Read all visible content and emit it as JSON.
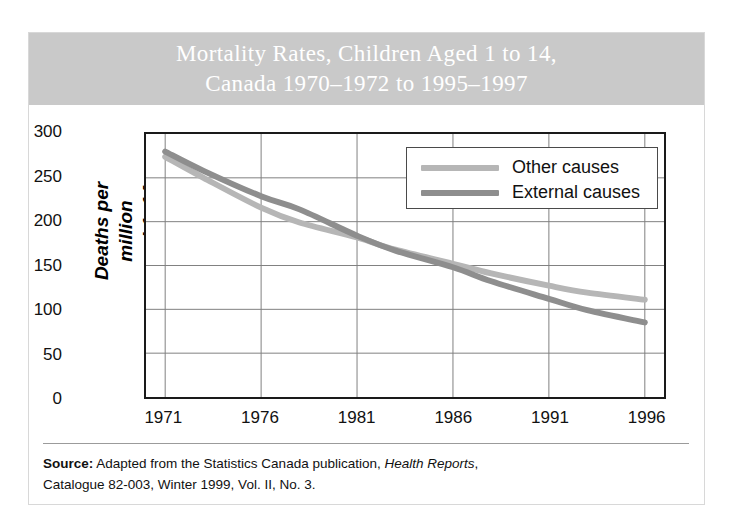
{
  "figure": {
    "title_line1": "Mortality Rates, Children Aged 1 to 14,",
    "title_line2": "Canada 1970–1972 to 1995–1997",
    "banner_color": "#c9c9c9",
    "source_label": "Source:",
    "source_text_1": "Adapted from the Statistics Canada publication,",
    "source_italic": "Health Reports",
    "source_text_2": ",",
    "source_line2": "Catalogue 82-003, Winter 1999, Vol. II, No. 3."
  },
  "chart_data": {
    "type": "line",
    "title": "Mortality Rates, Children Aged 1 to 14, Canada 1970–1972 to 1995–1997",
    "xlabel": "",
    "ylabel": "Deaths per million aged 1–14",
    "ylabel_line1": "Deaths per million",
    "ylabel_line2": "aged 1–14",
    "xlim": [
      1970,
      1997
    ],
    "ylim": [
      0,
      300
    ],
    "yticks": [
      0,
      50,
      100,
      150,
      200,
      250,
      300
    ],
    "xticks": [
      1971,
      1976,
      1981,
      1986,
      1991,
      1996
    ],
    "grid": true,
    "legend_position": "top-right",
    "x": [
      1971,
      1973,
      1976,
      1978,
      1981,
      1983,
      1986,
      1988,
      1991,
      1993,
      1996
    ],
    "series": [
      {
        "name": "Other causes",
        "color": "#b6b6b6",
        "values": [
          274,
          250,
          216,
          199,
          182,
          168,
          152,
          141,
          127,
          119,
          111
        ]
      },
      {
        "name": "External causes",
        "color": "#8e8e8e",
        "values": [
          280,
          258,
          229,
          214,
          184,
          167,
          148,
          132,
          112,
          99,
          85
        ]
      }
    ]
  }
}
